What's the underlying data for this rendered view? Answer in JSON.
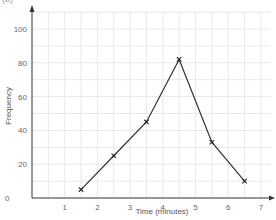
{
  "part_label": "(b)",
  "chart_data": {
    "type": "line",
    "title": "",
    "xlabel": "Time (minutes)",
    "ylabel": "Frequency",
    "x": [
      1.5,
      2.5,
      3.5,
      4.5,
      5.5,
      6.5
    ],
    "values": [
      5,
      25,
      45,
      82,
      33,
      10
    ],
    "series": [
      {
        "name": "Frequency polygon",
        "x": [
          1.5,
          2.5,
          3.5,
          4.5,
          5.5,
          6.5
        ],
        "values": [
          5,
          25,
          45,
          82,
          33,
          10
        ],
        "marker": "x",
        "color": "#333333"
      }
    ],
    "xticks": [
      "1",
      "2",
      "3",
      "4",
      "5",
      "6",
      "7"
    ],
    "yticks": [
      "0",
      "20",
      "40",
      "60",
      "80",
      "100"
    ],
    "xlim": [
      0,
      7.3
    ],
    "ylim": [
      0,
      110
    ],
    "grid": true,
    "legend": "none",
    "origin_label": "0"
  }
}
